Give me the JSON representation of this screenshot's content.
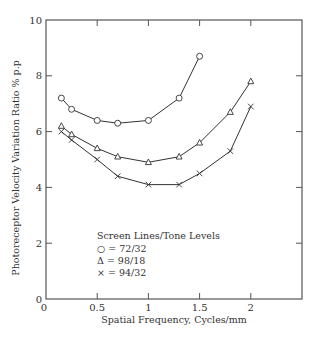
{
  "chart_data": {
    "type": "line",
    "title": "",
    "xlabel": "Spatial Frequency, Cycles/mm",
    "ylabel": "Photoreceptor Velocity Variation Ratio % p.p",
    "xlim": [
      0,
      2.5
    ],
    "ylim": [
      0,
      10
    ],
    "xticks": [
      0,
      0.5,
      1,
      1.5,
      2
    ],
    "xtick_labels": [
      "0",
      "0.5",
      "1",
      "1.5",
      "2"
    ],
    "yticks": [
      0,
      2,
      4,
      6,
      8,
      10
    ],
    "ytick_labels": [
      "0",
      "2",
      "4",
      "6",
      "8",
      "10"
    ],
    "grid": false,
    "legend": {
      "title": "Screen Lines/Tone Levels",
      "position": "lower-left inside",
      "entries": [
        "○ = 72/32",
        "Δ = 98/18",
        "× = 94/32"
      ]
    },
    "series": [
      {
        "name": "72/32",
        "marker": "circle",
        "x": [
          0.15,
          0.25,
          0.5,
          0.7,
          1.0,
          1.3,
          1.5
        ],
        "y": [
          7.2,
          6.8,
          6.4,
          6.3,
          6.4,
          7.2,
          8.7
        ]
      },
      {
        "name": "98/18",
        "marker": "triangle",
        "x": [
          0.15,
          0.25,
          0.5,
          0.7,
          1.0,
          1.3,
          1.5,
          1.8,
          2.0
        ],
        "y": [
          6.2,
          5.9,
          5.4,
          5.1,
          4.9,
          5.1,
          5.6,
          6.7,
          7.8
        ]
      },
      {
        "name": "94/32",
        "marker": "x",
        "x": [
          0.15,
          0.25,
          0.5,
          0.7,
          1.0,
          1.3,
          1.5,
          1.8,
          2.0
        ],
        "y": [
          6.0,
          5.7,
          5.0,
          4.4,
          4.1,
          4.1,
          4.5,
          5.3,
          6.9
        ]
      }
    ]
  }
}
